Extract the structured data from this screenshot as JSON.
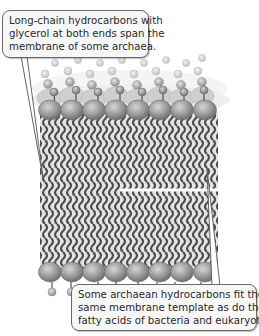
{
  "figure": {
    "type": "membrane-diagram",
    "palette": {
      "head_dark": "#8c8c8c",
      "head_light": "#c8c8c8",
      "chain": "#555555",
      "core_bg": "#dedede",
      "callout_bg": "#f7f7f7",
      "callout_border": "#6a6a6a"
    }
  },
  "callouts": {
    "top": {
      "lines": [
        "Long-chain hydrocarbons with",
        "glycerol at both ends span the",
        "membrane of some archaea."
      ]
    },
    "bottom": {
      "lines": [
        "Some archaean hydrocarbons fit the",
        "same membrane template as do the",
        "fatty acids of bacteria and eukaryotes."
      ]
    }
  }
}
